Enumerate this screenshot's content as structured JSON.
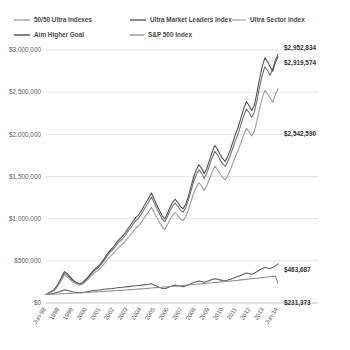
{
  "chart_data": {
    "type": "line",
    "title": "",
    "xlabel": "",
    "ylabel": "",
    "ylim": [
      0,
      3000000
    ],
    "grid": true,
    "legend_position": "top",
    "y_ticks": [
      "$0",
      "$500,000",
      "$1,000,000",
      "$1,500,000",
      "$2,000,000",
      "$2,500,000",
      "$3,000,000"
    ],
    "y_tick_values": [
      0,
      500000,
      1000000,
      1500000,
      2000000,
      2500000,
      3000000
    ],
    "x_tick_labels": [
      "Jun-98",
      "1998",
      "1999",
      "2000",
      "2001",
      "2002",
      "2003",
      "2004",
      "2005",
      "2006",
      "2007",
      "2008",
      "2009",
      "2010",
      "2011",
      "2012",
      "2013",
      "Jun-14"
    ],
    "end_labels": [
      {
        "text": "$2,952,834",
        "series": "50/50 Ultra Indexes",
        "value": 2952834
      },
      {
        "text": "$2,919,574",
        "series": "Ultra Market Leaders Index",
        "value": 2919574
      },
      {
        "text": "$2,542,590",
        "series": "Ultra Sector Index",
        "value": 2542590
      },
      {
        "text": "$463,687",
        "series": "S&P 500 Index",
        "value": 463687
      },
      {
        "text": "$231,373",
        "series": "Aim Higher Goal",
        "value": 231373
      }
    ],
    "series": [
      {
        "name": "50/50 Ultra Indexes",
        "color": "#6e6e6e",
        "values": [
          100000,
          118000,
          132000,
          150000,
          188000,
          236000,
          300000,
          352000,
          330000,
          300000,
          268000,
          248000,
          231000,
          222000,
          238000,
          268000,
          300000,
          336000,
          372000,
          400000,
          424000,
          460000,
          500000,
          548000,
          590000,
          620000,
          656000,
          700000,
          735000,
          762000,
          800000,
          846000,
          884000,
          930000,
          975000,
          1000000,
          1046000,
          1100000,
          1150000,
          1200000,
          1256000,
          1190000,
          1120000,
          1060000,
          1000000,
          960000,
          1020000,
          1090000,
          1150000,
          1185000,
          1150000,
          1100000,
          1078000,
          1130000,
          1220000,
          1330000,
          1440000,
          1520000,
          1580000,
          1540000,
          1480000,
          1540000,
          1630000,
          1720000,
          1800000,
          1760000,
          1700000,
          1650000,
          1620000,
          1680000,
          1760000,
          1850000,
          1940000,
          2020000,
          2120000,
          2220000,
          2300000,
          2260000,
          2200000,
          2260000,
          2400000,
          2560000,
          2700000,
          2800000,
          2760000,
          2700000,
          2780000,
          2880000,
          2952834
        ]
      },
      {
        "name": "Ultra Market Leaders Index",
        "color": "#4d4d4d",
        "values": [
          100000,
          120000,
          136000,
          156000,
          196000,
          248000,
          316000,
          372000,
          348000,
          316000,
          280000,
          256000,
          236000,
          226000,
          244000,
          276000,
          310000,
          348000,
          386000,
          416000,
          440000,
          478000,
          520000,
          570000,
          612000,
          644000,
          682000,
          728000,
          764000,
          790000,
          830000,
          878000,
          918000,
          966000,
          1012000,
          1038000,
          1086000,
          1142000,
          1194000,
          1246000,
          1304000,
          1236000,
          1162000,
          1100000,
          1038000,
          996000,
          1058000,
          1132000,
          1194000,
          1230000,
          1194000,
          1142000,
          1118000,
          1172000,
          1266000,
          1380000,
          1494000,
          1578000,
          1640000,
          1598000,
          1536000,
          1598000,
          1692000,
          1786000,
          1868000,
          1826000,
          1764000,
          1712000,
          1680000,
          1744000,
          1826000,
          1920000,
          2012000,
          2096000,
          2200000,
          2304000,
          2386000,
          2344000,
          2282000,
          2344000,
          2490000,
          2656000,
          2802000,
          2906000,
          2864000,
          2802000,
          2748000,
          2850000,
          2919574
        ]
      },
      {
        "name": "Ultra Sector Index",
        "color": "#9a9a9a",
        "values": [
          100000,
          116000,
          128000,
          144000,
          178000,
          222000,
          282000,
          330000,
          310000,
          282000,
          252000,
          234000,
          220000,
          212000,
          226000,
          252000,
          282000,
          314000,
          346000,
          372000,
          394000,
          426000,
          462000,
          504000,
          542000,
          570000,
          602000,
          640000,
          672000,
          696000,
          730000,
          770000,
          806000,
          846000,
          886000,
          910000,
          950000,
          998000,
          1042000,
          1086000,
          1136000,
          1078000,
          1014000,
          960000,
          906000,
          870000,
          924000,
          986000,
          1040000,
          1072000,
          1040000,
          996000,
          976000,
          1022000,
          1104000,
          1202000,
          1300000,
          1372000,
          1426000,
          1390000,
          1336000,
          1390000,
          1470000,
          1552000,
          1622000,
          1586000,
          1532000,
          1488000,
          1460000,
          1514000,
          1586000,
          1666000,
          1746000,
          1818000,
          1908000,
          1998000,
          2070000,
          2032000,
          1980000,
          2032000,
          2160000,
          2302000,
          2430000,
          2520000,
          2484000,
          2430000,
          2382000,
          2470000,
          2542590
        ]
      },
      {
        "name": "S&P 500 Index",
        "color": "#5a5a5a",
        "values": [
          100000,
          106000,
          110000,
          116000,
          124000,
          134000,
          146000,
          156000,
          150000,
          142000,
          134000,
          128000,
          124000,
          120000,
          124000,
          130000,
          136000,
          142000,
          148000,
          152000,
          154000,
          158000,
          162000,
          166000,
          170000,
          172000,
          176000,
          180000,
          183000,
          186000,
          190000,
          194000,
          197000,
          201000,
          205000,
          207000,
          211000,
          215000,
          219000,
          223000,
          228000,
          214000,
          200000,
          188000,
          176000,
          168000,
          180000,
          192000,
          204000,
          212000,
          206000,
          198000,
          194000,
          202000,
          214000,
          228000,
          242000,
          252000,
          260000,
          254000,
          246000,
          254000,
          266000,
          278000,
          288000,
          282000,
          274000,
          268000,
          264000,
          272000,
          282000,
          294000,
          306000,
          316000,
          330000,
          344000,
          356000,
          350000,
          342000,
          352000,
          372000,
          392000,
          410000,
          422000,
          416000,
          408000,
          420000,
          440000,
          463687
        ]
      },
      {
        "name": "Aim Higher Goal",
        "color": "#8c8c8c",
        "values": [
          100000,
          101500,
          103000,
          104500,
          106000,
          107600,
          109200,
          110800,
          112400,
          114000,
          115700,
          117400,
          119100,
          120800,
          122600,
          124400,
          126200,
          128000,
          129900,
          131800,
          133700,
          135600,
          137600,
          139600,
          141600,
          143600,
          145700,
          147800,
          149900,
          152000,
          154200,
          156400,
          158600,
          160800,
          163100,
          165400,
          167700,
          170000,
          172400,
          174800,
          177200,
          179600,
          182100,
          184600,
          187100,
          189600,
          192200,
          194800,
          197400,
          200000,
          202700,
          205400,
          208100,
          210800,
          213600,
          216400,
          219200,
          222000,
          224900,
          227800,
          230700,
          233600,
          236600,
          239600,
          242600,
          245600,
          248700,
          251800,
          254900,
          258000,
          261200,
          264400,
          267600,
          270800,
          274100,
          277400,
          280700,
          284000,
          287400,
          290800,
          294200,
          297600,
          301100,
          304600,
          308100,
          311600,
          315200,
          318800,
          231373
        ]
      }
    ],
    "legend": [
      {
        "label": "50/50 Ultra Indexes",
        "color": "#9a9a9a"
      },
      {
        "label": "Ultra Market Leaders Index",
        "color": "#4d4d4d"
      },
      {
        "label": "Ultra Sector Index",
        "color": "#a8a8a8"
      },
      {
        "label": "Aim Higher Goal",
        "color": "#3f3f3f"
      },
      {
        "label": "S&P 500 Index",
        "color": "#8c8c8c"
      }
    ]
  }
}
